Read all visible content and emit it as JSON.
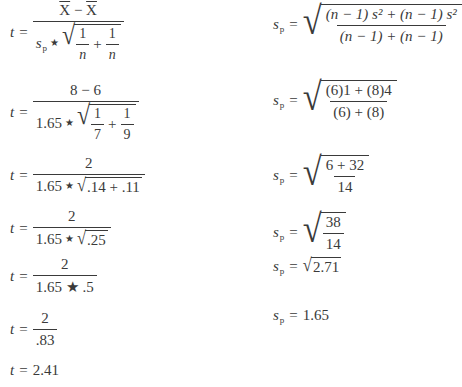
{
  "left": {
    "eq1": {
      "lhs": "t",
      "num_a": "X",
      "minus": "−",
      "num_b": "X",
      "sp_s": "s",
      "sp_sub": "p",
      "one": "1",
      "n": "n",
      "plus": "+"
    },
    "eq2": {
      "lhs": "t",
      "num": "8 − 6",
      "coef": "1.65",
      "one": "1",
      "d1": "7",
      "d2": "9",
      "plus": "+"
    },
    "eq3": {
      "lhs": "t",
      "num": "2",
      "coef": "1.65",
      "radicand": ".14 + .11"
    },
    "eq4": {
      "lhs": "t",
      "num": "2",
      "coef": "1.65",
      "radicand": ".25"
    },
    "eq5": {
      "lhs": "t",
      "num": "2",
      "den": "1.65 ★ .5"
    },
    "eq6": {
      "lhs": "t",
      "num": "2",
      "den": ".83"
    },
    "eq7": {
      "lhs": "t",
      "value": "2.41"
    }
  },
  "right": {
    "eq1": {
      "s": "s",
      "sub": "p",
      "num": "(n − 1) s² + (n − 1) s²",
      "den": "(n − 1) + (n − 1)"
    },
    "eq2": {
      "s": "s",
      "sub": "p",
      "num": "(6)1 + (8)4",
      "den": "(6) + (8)"
    },
    "eq3": {
      "s": "s",
      "sub": "p",
      "num": "6 + 32",
      "den": "14"
    },
    "eq4": {
      "s": "s",
      "sub": "p",
      "num": "38",
      "den": "14"
    },
    "eq5": {
      "s": "s",
      "sub": "p",
      "radicand": "2.71"
    },
    "eq6": {
      "s": "s",
      "sub": "p",
      "value": "1.65"
    }
  },
  "symbols": {
    "equals": "=",
    "star": "★",
    "radical": "√"
  }
}
